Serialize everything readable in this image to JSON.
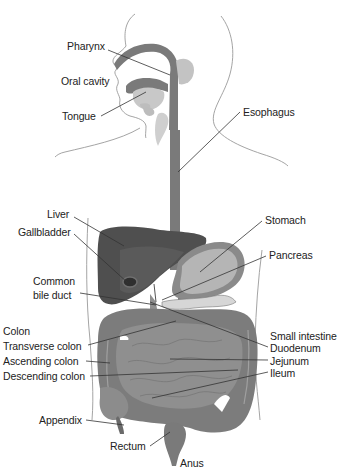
{
  "diagram": {
    "style": "grayscale anatomical illustration with leader lines",
    "colors": {
      "background": "#ffffff",
      "outline": "#9a9a9a",
      "tract": "#7a7a7a",
      "liver": "#4f4f4f",
      "gallbladder": "#3a3a3a",
      "stomach": "#b5b5b5",
      "stomach_rim": "#8a8a8a",
      "intestine": "#888888",
      "colon": "#7c7c7c",
      "pale_tissue": "#c8c8c8",
      "label_text": "#222222",
      "leader_line": "#333333"
    },
    "labels": [
      {
        "id": "pharynx",
        "text": "Pharynx",
        "x": 67,
        "y": 45
      },
      {
        "id": "oral-cavity",
        "text": "Oral cavity",
        "x": 61,
        "y": 78
      },
      {
        "id": "tongue",
        "text": "Tongue",
        "x": 62,
        "y": 112
      },
      {
        "id": "esophagus",
        "text": "Esophagus",
        "x": 243,
        "y": 107
      },
      {
        "id": "liver",
        "text": "Liver",
        "x": 47,
        "y": 209
      },
      {
        "id": "gallbladder",
        "text": "Gallbladder",
        "x": 18,
        "y": 228
      },
      {
        "id": "stomach",
        "text": "Stomach",
        "x": 265,
        "y": 215
      },
      {
        "id": "pancreas",
        "text": "Pancreas",
        "x": 269,
        "y": 250
      },
      {
        "id": "common-bile-duct-1",
        "text": "Common",
        "x": 33,
        "y": 276
      },
      {
        "id": "common-bile-duct-2",
        "text": "bile duct",
        "x": 33,
        "y": 290
      },
      {
        "id": "colon",
        "text": "Colon",
        "x": 3,
        "y": 325
      },
      {
        "id": "transverse-colon",
        "text": "Transverse colon",
        "x": 3,
        "y": 340
      },
      {
        "id": "ascending-colon",
        "text": "Ascending colon",
        "x": 3,
        "y": 356
      },
      {
        "id": "descending-colon",
        "text": "Descending colon",
        "x": 3,
        "y": 371
      },
      {
        "id": "small-intestine",
        "text": "Small intestine",
        "x": 270,
        "y": 330
      },
      {
        "id": "duodenum",
        "text": "Duodenum",
        "x": 270,
        "y": 343
      },
      {
        "id": "jejunum",
        "text": "Jejunum",
        "x": 270,
        "y": 356
      },
      {
        "id": "ileum",
        "text": "Ileum",
        "x": 270,
        "y": 368
      },
      {
        "id": "appendix",
        "text": "Appendix",
        "x": 39,
        "y": 414
      },
      {
        "id": "rectum",
        "text": "Rectum",
        "x": 110,
        "y": 440
      },
      {
        "id": "anus",
        "text": "Anus",
        "x": 180,
        "y": 457
      }
    ]
  }
}
